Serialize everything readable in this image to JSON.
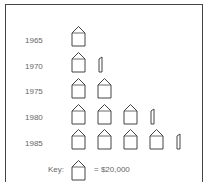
{
  "chart_data": {
    "type": "pictograph",
    "title": "",
    "unit_icon": "house-icon",
    "unit_value": 20000,
    "categories": [
      "1965",
      "1970",
      "1975",
      "1980",
      "1985"
    ],
    "icon_counts": [
      1,
      1.25,
      2,
      3.25,
      4.25
    ],
    "values": [
      20000,
      25000,
      40000,
      65000,
      85000
    ],
    "xlabel": "",
    "ylabel": "",
    "legend": {
      "label": "Key:",
      "text": "= $20,000"
    }
  },
  "rows": [
    {
      "year": "1965"
    },
    {
      "year": "1970"
    },
    {
      "year": "1975"
    },
    {
      "year": "1980"
    },
    {
      "year": "1985"
    }
  ],
  "key": {
    "label": "Key:",
    "value": "= $20,000"
  }
}
